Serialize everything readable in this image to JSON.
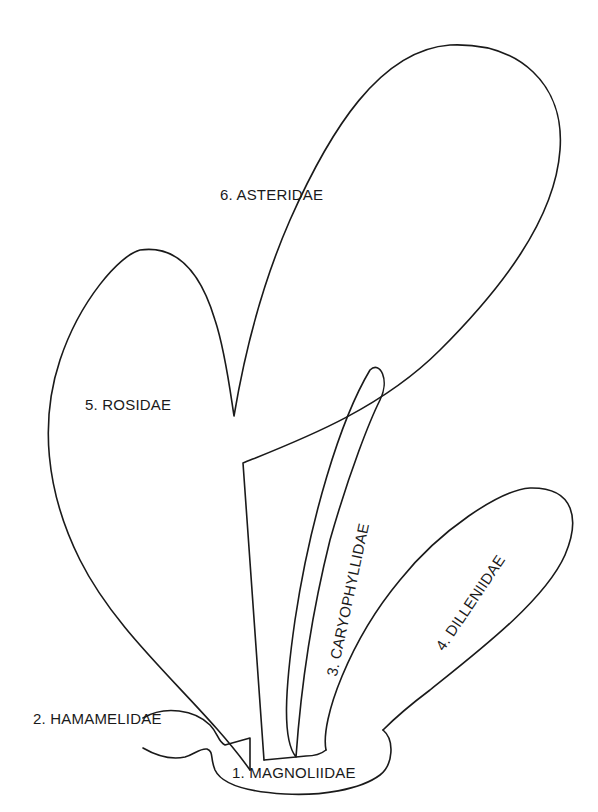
{
  "diagram": {
    "type": "phylogenetic-balloon-diagram",
    "colors": {
      "line": "#1a1a1a",
      "background": "#ffffff"
    },
    "groups": [
      {
        "number": 1,
        "name": "MAGNOLIIDAE",
        "label": "1.  MAGNOLIIDAE",
        "position": "base"
      },
      {
        "number": 2,
        "name": "HAMAMELIDAE",
        "label": "2.  HAMAMELIDAE",
        "position": "lower-left branch"
      },
      {
        "number": 3,
        "name": "CARYOPHYLLIDAE",
        "label": "3.  CARYOPHYLLIDAE",
        "position": "narrow upright branch"
      },
      {
        "number": 4,
        "name": "DILLENIIDAE",
        "label": "4.  DILLENIIDAE",
        "position": "right diagonal branch"
      },
      {
        "number": 5,
        "name": "ROSIDAE",
        "label": "5.  ROSIDAE",
        "position": "large left lobe"
      },
      {
        "number": 6,
        "name": "ASTERIDAE",
        "label": "6.  ASTERIDAE",
        "position": "top lobe arising from Rosidae"
      }
    ]
  }
}
